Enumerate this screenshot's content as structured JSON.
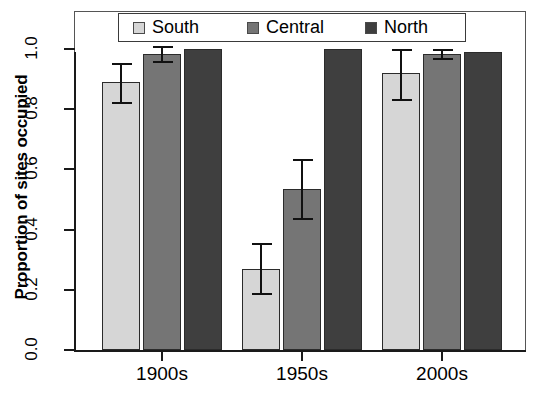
{
  "chart_data": {
    "type": "bar",
    "title": "",
    "xlabel": "",
    "ylabel": "Proportion of sites occupied",
    "categories": [
      "1900s",
      "1950s",
      "2000s"
    ],
    "ylim": [
      0.0,
      1.08
    ],
    "yticks": [
      "0.0",
      "0.2",
      "0.4",
      "0.6",
      "0.8",
      "1.0"
    ],
    "ytick_values": [
      0.0,
      0.2,
      0.4,
      0.6,
      0.8,
      1.0
    ],
    "grid": false,
    "legend_position": "top-center",
    "series": [
      {
        "name": "South",
        "color": "#d6d6d6",
        "values": [
          0.89,
          0.27,
          0.92
        ],
        "err_low": [
          0.825,
          0.19,
          0.835
        ],
        "err_high": [
          0.955,
          0.355,
          1.0
        ]
      },
      {
        "name": "Central",
        "color": "#757575",
        "values": [
          0.985,
          0.535,
          0.985
        ],
        "err_low": [
          0.96,
          0.44,
          0.97
        ],
        "err_high": [
          1.01,
          0.635,
          1.0
        ]
      },
      {
        "name": "North",
        "color": "#3f3f3f",
        "values": [
          1.0,
          1.0,
          0.99
        ],
        "err_low": [
          null,
          null,
          null
        ],
        "err_high": [
          null,
          null,
          null
        ]
      }
    ]
  },
  "legend": {
    "entries": [
      {
        "label": "South",
        "swatch": "#d6d6d6"
      },
      {
        "label": "Central",
        "swatch": "#757575"
      },
      {
        "label": "North",
        "swatch": "#3f3f3f"
      }
    ]
  },
  "axis": {
    "y_title": "Proportion of sites occupied",
    "y_ticks": [
      "1.0",
      "0.8",
      "0.6",
      "0.4",
      "0.2",
      "0.0"
    ],
    "x_ticks": [
      "1900s",
      "1950s",
      "2000s"
    ]
  },
  "caption_sliver": ""
}
